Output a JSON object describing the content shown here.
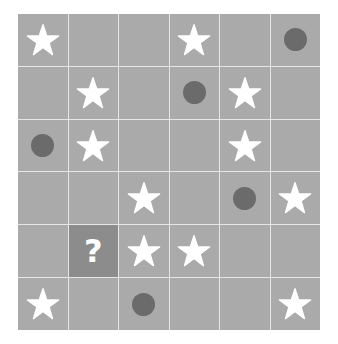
{
  "puzzle": {
    "rows": 6,
    "cols": 6,
    "colors": {
      "cell_background": "#aaaaaa",
      "unknown_cell_background": "#8c8c8c",
      "gridline": "#e6e6e6",
      "star": "#ffffff",
      "circle": "#6b6b6b",
      "question_mark": "#ffffff"
    },
    "unknown_symbol": "?",
    "grid": [
      [
        "star",
        "empty",
        "empty",
        "star",
        "empty",
        "circle"
      ],
      [
        "empty",
        "star",
        "empty",
        "circle",
        "star",
        "empty"
      ],
      [
        "circle",
        "star",
        "empty",
        "empty",
        "star",
        "empty"
      ],
      [
        "empty",
        "empty",
        "star",
        "empty",
        "circle",
        "star"
      ],
      [
        "empty",
        "unknown",
        "star",
        "star",
        "empty",
        "empty"
      ],
      [
        "star",
        "empty",
        "circle",
        "empty",
        "empty",
        "star"
      ]
    ]
  }
}
